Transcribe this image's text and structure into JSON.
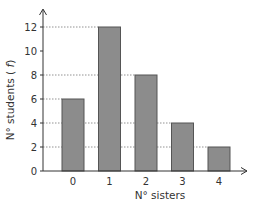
{
  "chart_data": {
    "type": "bar",
    "title": "",
    "xlabel": "N° sisters",
    "ylabel": "N° students (f)",
    "categories": [
      "0",
      "1",
      "2",
      "3",
      "4"
    ],
    "values": [
      6,
      12,
      8,
      4,
      2
    ],
    "ylim": [
      0,
      13
    ],
    "yticks": [
      0,
      2,
      4,
      6,
      8,
      10,
      12
    ],
    "grid": "dotted lines from y-axis to bar tops",
    "legend": null,
    "colors": {
      "bar_fill": "#8c8c8c",
      "bar_stroke": "#555555",
      "axis": "#333333",
      "grid": "#777777"
    }
  }
}
